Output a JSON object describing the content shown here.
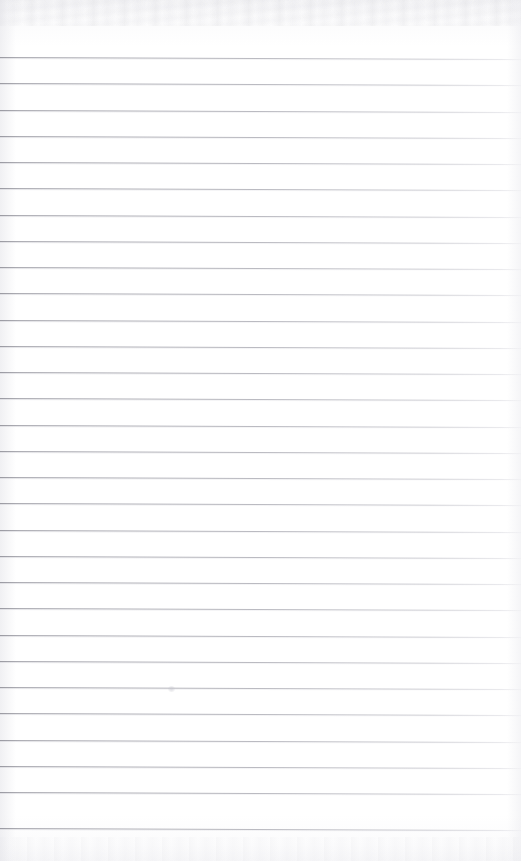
{
  "document": {
    "type": "scanned-ruled-notebook-page",
    "title": "Blank Ruled Notebook Page",
    "description": "A scanned blank sheet of wide-ruled notebook paper with no handwriting or printed text.",
    "page_width": 521,
    "page_height": 861,
    "background_color": "#fefefe",
    "paper_tint": "#fafafb",
    "has_text_content": "No text content",
    "has_margin_rule": "No vertical margin rule",
    "has_holes": "No punched holes"
  },
  "rules": {
    "label": "Ruled lines",
    "count": 30,
    "color": "#a2a2aa",
    "line_weight_px": 1,
    "first_line_y": 57,
    "spacing_px": 26.3,
    "slope_deg": 0.22,
    "left_margin_px": 0,
    "right_extent_px": 521,
    "positions": [
      57,
      83,
      110,
      136,
      162,
      188,
      215,
      241,
      267,
      293,
      320,
      346,
      372,
      398,
      425,
      451,
      477,
      503,
      530,
      556,
      582,
      608,
      635,
      661,
      687,
      713,
      740,
      766,
      792,
      828
    ]
  },
  "artifacts": {
    "label": "Scan artifacts",
    "top_noise_band_height": 26,
    "bottom_noise_band_height": 24,
    "specks": [
      {
        "name": "paper-speck",
        "x": 168,
        "y": 686,
        "size": 7
      }
    ]
  }
}
